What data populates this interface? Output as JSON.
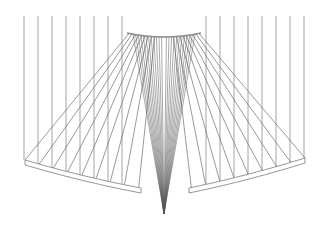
{
  "diagram": {
    "colors": {
      "background": "#ffffff",
      "vertical_lines": "#9a9a9a",
      "cables": "#6e6e6e",
      "fan": "#555555",
      "plank_stroke": "#7a7a7a"
    },
    "top_y": 16,
    "left_verticals_x": [
      24,
      38,
      52,
      66,
      80,
      94,
      108,
      122
    ],
    "right_verticals_x": [
      206,
      220,
      234,
      248,
      262,
      276,
      290,
      304
    ],
    "top_arc": {
      "x1": 127,
      "x2": 201,
      "y_ends": 33,
      "y_mid": 37
    },
    "left_plank": {
      "x1": 25,
      "y1": 160,
      "x2": 141,
      "y2": 188,
      "thickness": 5
    },
    "right_plank": {
      "x1": 189,
      "y1": 188,
      "x2": 305,
      "y2": 158,
      "thickness": 5
    },
    "apex": {
      "x": 164,
      "y": 214
    }
  }
}
